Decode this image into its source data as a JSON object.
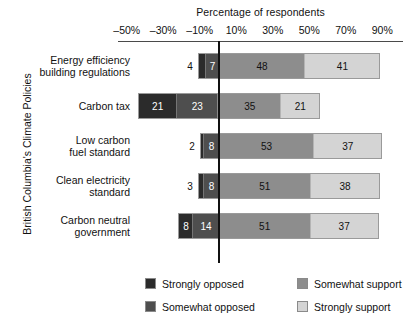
{
  "chart_data": {
    "type": "bar",
    "orientation": "horizontal",
    "stacking": "diverging-stacked",
    "title": "",
    "xlabel": "Percentage of respondents",
    "ylabel": "British Columbia's Climate Policies",
    "xlim": [
      -60,
      100
    ],
    "xticks": [
      -50,
      -30,
      -10,
      10,
      30,
      50,
      70,
      90
    ],
    "xticklabels": [
      "–50%",
      "–30%",
      "–10%",
      "10%",
      "30%",
      "50%",
      "70%",
      "90%"
    ],
    "grid": false,
    "zero_reference_line": 0,
    "legend_position": "bottom",
    "categories": [
      "Energy efficiency building regulations",
      "Carbon tax",
      "Low carbon fuel standard",
      "Clean electricity standard",
      "Carbon neutral government"
    ],
    "category_lines": [
      [
        "Energy efficiency",
        "building regulations"
      ],
      [
        "Carbon tax"
      ],
      [
        "Low carbon",
        "fuel standard"
      ],
      [
        "Clean electricity",
        "standard"
      ],
      [
        "Carbon neutral",
        "government"
      ]
    ],
    "series": [
      {
        "name": "Strongly opposed",
        "color": "#2b2b2b",
        "side": "negative",
        "values": [
          4,
          21,
          2,
          3,
          8
        ]
      },
      {
        "name": "Somewhat opposed",
        "color": "#4e4e4e",
        "side": "negative",
        "values": [
          7,
          23,
          8,
          8,
          14
        ]
      },
      {
        "name": "Somewhat support",
        "color": "#8d8d8d",
        "side": "positive",
        "values": [
          48,
          35,
          53,
          51,
          51
        ]
      },
      {
        "name": "Strongly support",
        "color": "#d4d4d4",
        "side": "positive",
        "values": [
          41,
          21,
          37,
          38,
          37
        ]
      }
    ],
    "data_labels": [
      {
        "category": "Energy efficiency building regulations",
        "Strongly opposed": 4,
        "Somewhat opposed": 7,
        "Somewhat support": 48,
        "Strongly support": 41
      },
      {
        "category": "Carbon tax",
        "Strongly opposed": 21,
        "Somewhat opposed": 23,
        "Somewhat support": 35,
        "Strongly support": 21
      },
      {
        "category": "Low carbon fuel standard",
        "Strongly opposed": 2,
        "Somewhat opposed": 8,
        "Somewhat support": 53,
        "Strongly support": 37
      },
      {
        "category": "Clean electricity standard",
        "Strongly opposed": 3,
        "Somewhat opposed": 8,
        "Somewhat support": 51,
        "Strongly support": 38
      },
      {
        "category": "Carbon neutral government",
        "Strongly opposed": 8,
        "Somewhat opposed": 14,
        "Somewhat support": 51,
        "Strongly support": 37
      }
    ]
  },
  "legend": {
    "items": [
      {
        "label": "Strongly opposed",
        "color": "#2b2b2b"
      },
      {
        "label": "Somewhat support",
        "color": "#8d8d8d"
      },
      {
        "label": "Somewhat opposed",
        "color": "#4e4e4e"
      },
      {
        "label": "Strongly support",
        "color": "#d4d4d4"
      }
    ]
  }
}
